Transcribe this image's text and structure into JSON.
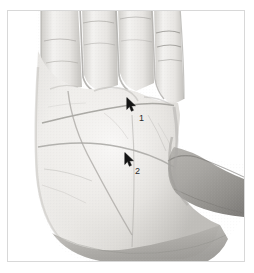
{
  "image": {
    "kind": "photograph",
    "subject": "open human palm, right hand, fingers pointing up, thumb to the right",
    "colorspace": "grayscale",
    "background_color": "#ffffff",
    "frame_border_color": "#d8d8d8",
    "skin_light": "#f2f1ef",
    "skin_mid": "#d9d7d4",
    "skin_shadow": "#9a9995",
    "crease_color": "#8d8b87"
  },
  "annotations": {
    "cursor_color": "#141414",
    "label_color": "#2a2a2a",
    "points": [
      {
        "id": "1",
        "label": "1",
        "cursor_x": 126,
        "cursor_y": 97,
        "label_x": 139,
        "label_y": 114
      },
      {
        "id": "2",
        "label": "2",
        "cursor_x": 124,
        "cursor_y": 152,
        "label_x": 135,
        "label_y": 167
      }
    ]
  }
}
